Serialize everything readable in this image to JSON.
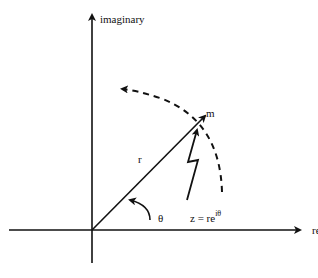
{
  "diagram": {
    "type": "complex-plane-polar-form",
    "axes": {
      "horizontal_label": "real",
      "vertical_label": "imaginary"
    },
    "labels": {
      "magnitude": "r",
      "angle": "θ",
      "point": "m",
      "equation_base": "z = re",
      "equation_exponent": "iθ"
    },
    "colors": {
      "ink": "#111111",
      "background": "#ffffff"
    }
  }
}
